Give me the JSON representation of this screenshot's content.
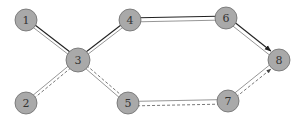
{
  "diagram": {
    "title": "",
    "colors": {
      "background": "#ffffff",
      "node_fill": "#a9a9a9",
      "node_stroke": "#6b6b6b",
      "dark_line": "#222222",
      "gray_line": "#8a8a8a",
      "dashed_line": "#555555"
    },
    "nodes": [
      {
        "id": "1",
        "label": "1",
        "x": 26,
        "y": 20,
        "r": 11
      },
      {
        "id": "2",
        "label": "2",
        "x": 26,
        "y": 103,
        "r": 11
      },
      {
        "id": "3",
        "label": "3",
        "x": 78,
        "y": 60,
        "r": 12
      },
      {
        "id": "4",
        "label": "4",
        "x": 130,
        "y": 20,
        "r": 11
      },
      {
        "id": "5",
        "label": "5",
        "x": 128,
        "y": 103,
        "r": 11
      },
      {
        "id": "6",
        "label": "6",
        "x": 226,
        "y": 18,
        "r": 11
      },
      {
        "id": "7",
        "label": "7",
        "x": 228,
        "y": 101,
        "r": 11
      },
      {
        "id": "8",
        "label": "8",
        "x": 279,
        "y": 60,
        "r": 11
      }
    ],
    "edges": [
      {
        "from": "1",
        "to": "3",
        "style": "solid-dark",
        "offset": -1.5,
        "arrow": false
      },
      {
        "from": "1",
        "to": "3",
        "style": "solid-gray",
        "offset": 1.5,
        "arrow": false
      },
      {
        "from": "3",
        "to": "4",
        "style": "solid-dark",
        "offset": -1.5,
        "arrow": false
      },
      {
        "from": "3",
        "to": "4",
        "style": "solid-gray",
        "offset": 1.5,
        "arrow": false
      },
      {
        "from": "2",
        "to": "3",
        "style": "solid-gray",
        "offset": -1.5,
        "arrow": false
      },
      {
        "from": "2",
        "to": "3",
        "style": "dashed",
        "offset": 1.5,
        "arrow": false
      },
      {
        "from": "3",
        "to": "5",
        "style": "solid-gray",
        "offset": 1.5,
        "arrow": false
      },
      {
        "from": "3",
        "to": "5",
        "style": "dashed",
        "offset": -1.5,
        "arrow": false
      },
      {
        "from": "4",
        "to": "6",
        "style": "solid-dark",
        "offset": -2,
        "arrow": false
      },
      {
        "from": "4",
        "to": "6",
        "style": "solid-gray",
        "offset": 2,
        "arrow": false
      },
      {
        "from": "6",
        "to": "8",
        "style": "solid-dark",
        "offset": -2,
        "arrow": true
      },
      {
        "from": "6",
        "to": "8",
        "style": "solid-gray",
        "offset": 2,
        "arrow": false
      },
      {
        "from": "5",
        "to": "7",
        "style": "solid-gray",
        "offset": -1.5,
        "arrow": false
      },
      {
        "from": "5",
        "to": "7",
        "style": "dashed",
        "offset": 3,
        "arrow": false
      },
      {
        "from": "7",
        "to": "8",
        "style": "solid-gray",
        "offset": -2,
        "arrow": false
      },
      {
        "from": "7",
        "to": "8",
        "style": "dashed",
        "offset": 2,
        "arrow": true
      }
    ]
  }
}
